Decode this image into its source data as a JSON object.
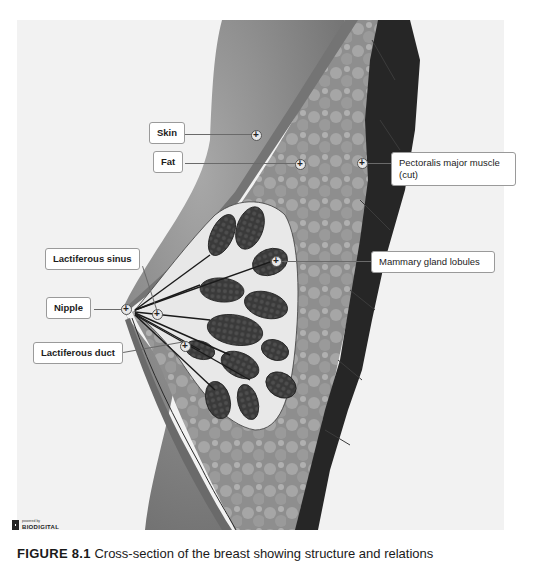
{
  "figure": {
    "caption_number": "FIGURE 8.1",
    "caption_text": "Cross-section of the breast showing structure and relations"
  },
  "branding": {
    "powered_by": "powered by",
    "name": "BIODIGITAL"
  },
  "labels": {
    "skin": "Skin",
    "fat": "Fat",
    "pectoralis": "Pectoralis major muscle (cut)",
    "mammary": "Mammary gland lobules",
    "sinus": "Lactiferous sinus",
    "nipple": "Nipple",
    "duct": "Lactiferous duct"
  },
  "markers": {
    "symbol": "+"
  },
  "colors": {
    "panel_bg": "#f2f2f2",
    "skin_band": "#7a7a7a",
    "fat_tissue": "#9c9c9c",
    "muscle": "#2a2a2a",
    "lobules": "#3a3a3a",
    "gland_bg": "#e6e6e6"
  }
}
